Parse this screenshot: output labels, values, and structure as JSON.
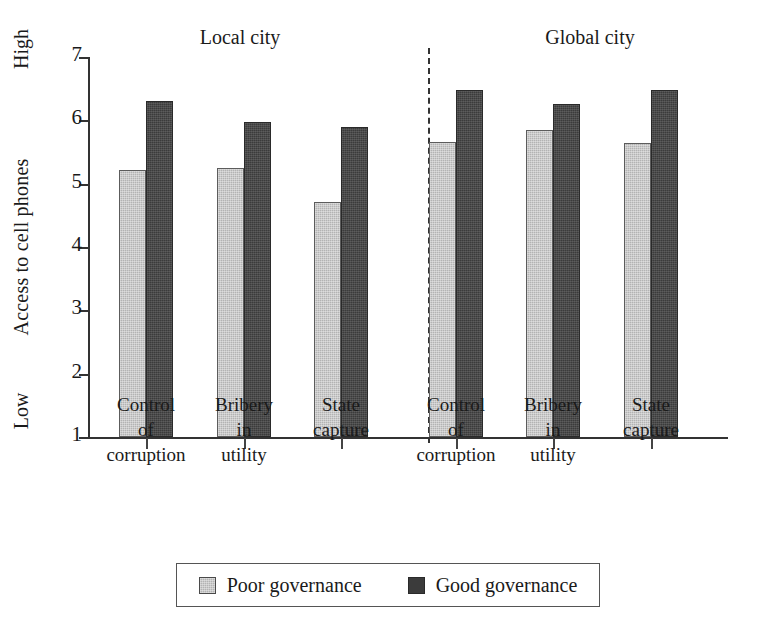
{
  "chart_data": {
    "type": "bar",
    "title": "",
    "xlabel": "",
    "ylabel": "Access to cell phones",
    "ylim": [
      1,
      7
    ],
    "yticks": [
      7,
      6,
      5,
      4,
      3,
      2,
      1
    ],
    "y_axis_high_label": "High",
    "y_axis_low_label": "Low",
    "grid": false,
    "legend_position": "bottom",
    "panels": [
      {
        "name": "Local city"
      },
      {
        "name": "Global city"
      }
    ],
    "categories": [
      "Control of corruption",
      "Bribery in utility",
      "State capture",
      "Control of corruption",
      "Bribery in utility",
      "State capture"
    ],
    "series": [
      {
        "name": "Poor governance",
        "color": "#b3b3b3",
        "values": [
          5.21,
          5.24,
          4.71,
          5.66,
          5.84,
          5.65
        ]
      },
      {
        "name": "Good governance",
        "color": "#3b3b3b",
        "values": [
          6.31,
          5.97,
          5.89,
          6.48,
          6.26,
          6.48
        ]
      }
    ],
    "groups": [
      {
        "panel": "Local city",
        "label_lines": [
          "Control",
          "of",
          "corruption"
        ],
        "poor": 5.21,
        "good": 6.31
      },
      {
        "panel": "Local city",
        "label_lines": [
          "Bribery",
          "in",
          "utility"
        ],
        "poor": 5.24,
        "good": 5.97
      },
      {
        "panel": "Local city",
        "label_lines": [
          "State",
          "capture",
          ""
        ],
        "poor": 4.71,
        "good": 5.89
      },
      {
        "panel": "Global city",
        "label_lines": [
          "Control",
          "of",
          "corruption"
        ],
        "poor": 5.66,
        "good": 6.48
      },
      {
        "panel": "Global city",
        "label_lines": [
          "Bribery",
          "in",
          "utility"
        ],
        "poor": 5.84,
        "good": 6.26
      },
      {
        "panel": "Global city",
        "label_lines": [
          "State",
          "capture",
          ""
        ],
        "poor": 5.65,
        "good": 6.48
      }
    ]
  },
  "axis": {
    "ylabel": "Access to cell phones",
    "high": "High",
    "low": "Low",
    "ticks": [
      "7",
      "6",
      "5",
      "4",
      "3",
      "2",
      "1"
    ]
  },
  "panels": {
    "local": "Local city",
    "global": "Global city"
  },
  "categories": [
    {
      "l1": "Control",
      "l2": "of",
      "l3": "corruption"
    },
    {
      "l1": "Bribery",
      "l2": "in",
      "l3": "utility"
    },
    {
      "l1": "State",
      "l2": "capture",
      "l3": ""
    },
    {
      "l1": "Control",
      "l2": "of",
      "l3": "corruption"
    },
    {
      "l1": "Bribery",
      "l2": "in",
      "l3": "utility"
    },
    {
      "l1": "State",
      "l2": "capture",
      "l3": ""
    }
  ],
  "legend": {
    "items": [
      {
        "label": "Poor governance",
        "color": "#b3b3b3"
      },
      {
        "label": "Good governance",
        "color": "#3b3b3b"
      }
    ]
  }
}
